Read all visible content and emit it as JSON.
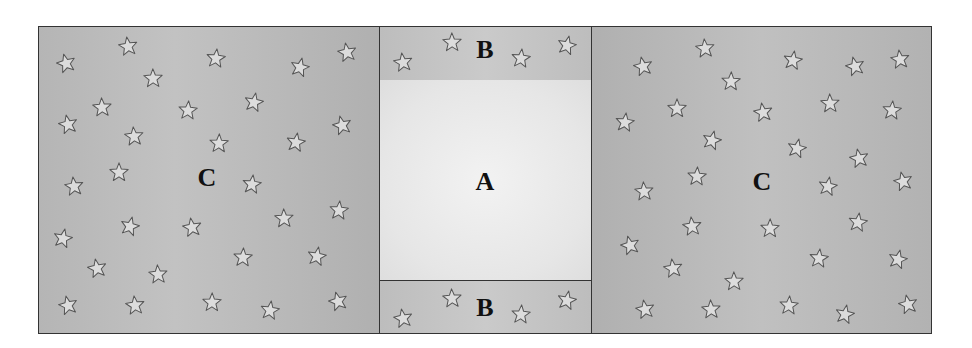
{
  "diagram": {
    "regions": [
      {
        "id": "c-left",
        "label": "C",
        "label_pos": [
          207,
          178
        ]
      },
      {
        "id": "b-top",
        "label": "B",
        "label_pos": [
          485,
          50
        ]
      },
      {
        "id": "a-mid",
        "label": "A",
        "label_pos": [
          485,
          182
        ]
      },
      {
        "id": "b-bot",
        "label": "B",
        "label_pos": [
          485,
          308
        ]
      },
      {
        "id": "c-right",
        "label": "C",
        "label_pos": [
          762,
          182
        ]
      }
    ],
    "colors": {
      "star_fill": "#dcdcdc",
      "star_stroke": "#555555",
      "border": "#333333"
    },
    "stars": [
      [
        66,
        63
      ],
      [
        128,
        46
      ],
      [
        153,
        78
      ],
      [
        216,
        58
      ],
      [
        300,
        67
      ],
      [
        347,
        52
      ],
      [
        102,
        107
      ],
      [
        188,
        110
      ],
      [
        254,
        102
      ],
      [
        68,
        124
      ],
      [
        134,
        136
      ],
      [
        219,
        143
      ],
      [
        296,
        142
      ],
      [
        342,
        125
      ],
      [
        74,
        186
      ],
      [
        119,
        172
      ],
      [
        252,
        184
      ],
      [
        130,
        226
      ],
      [
        192,
        227
      ],
      [
        284,
        218
      ],
      [
        339,
        210
      ],
      [
        63,
        238
      ],
      [
        97,
        268
      ],
      [
        158,
        274
      ],
      [
        243,
        257
      ],
      [
        317,
        256
      ],
      [
        68,
        305
      ],
      [
        135,
        305
      ],
      [
        212,
        302
      ],
      [
        270,
        310
      ],
      [
        338,
        301
      ],
      [
        403,
        62
      ],
      [
        452,
        42
      ],
      [
        521,
        58
      ],
      [
        567,
        45
      ],
      [
        403,
        318
      ],
      [
        452,
        298
      ],
      [
        521,
        314
      ],
      [
        567,
        300
      ],
      [
        643,
        66
      ],
      [
        705,
        48
      ],
      [
        731,
        81
      ],
      [
        793,
        60
      ],
      [
        855,
        66
      ],
      [
        900,
        59
      ],
      [
        677,
        108
      ],
      [
        625,
        122
      ],
      [
        712,
        140
      ],
      [
        763,
        112
      ],
      [
        830,
        103
      ],
      [
        892,
        110
      ],
      [
        797,
        148
      ],
      [
        859,
        158
      ],
      [
        644,
        191
      ],
      [
        697,
        176
      ],
      [
        828,
        186
      ],
      [
        903,
        181
      ],
      [
        692,
        226
      ],
      [
        770,
        228
      ],
      [
        858,
        222
      ],
      [
        630,
        245
      ],
      [
        673,
        268
      ],
      [
        734,
        281
      ],
      [
        819,
        258
      ],
      [
        898,
        259
      ],
      [
        645,
        309
      ],
      [
        711,
        309
      ],
      [
        789,
        305
      ],
      [
        845,
        314
      ],
      [
        908,
        304
      ]
    ]
  }
}
